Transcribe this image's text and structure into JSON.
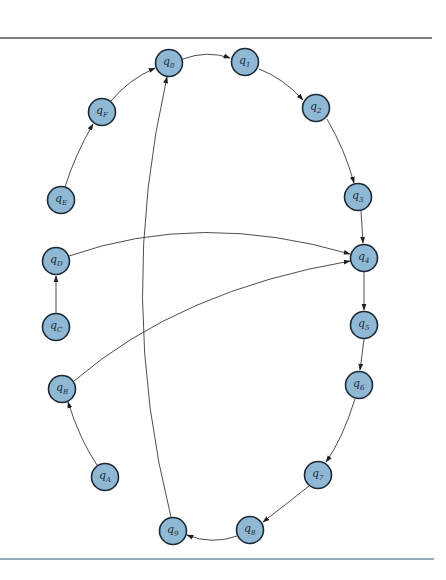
{
  "diagram": {
    "type": "directed-graph",
    "rules": {
      "top": {
        "y": 38,
        "x1": 0,
        "x2": 432,
        "color": "#555555"
      },
      "bottom": {
        "y": 559,
        "x1": 0,
        "x2": 434,
        "color": "#6f8fa6"
      }
    },
    "node_style": {
      "radius": 13.5,
      "fill": "#8fb8d4",
      "stroke": "#1c2a35"
    },
    "nodes": [
      {
        "id": "q0",
        "label": "q",
        "sub": "0",
        "x": 169,
        "y": 63
      },
      {
        "id": "q1",
        "label": "q",
        "sub": "1",
        "x": 245,
        "y": 62
      },
      {
        "id": "q2",
        "label": "q",
        "sub": "2",
        "x": 316,
        "y": 108
      },
      {
        "id": "q3",
        "label": "q",
        "sub": "3",
        "x": 358,
        "y": 197
      },
      {
        "id": "q4",
        "label": "q",
        "sub": "4",
        "x": 364,
        "y": 258
      },
      {
        "id": "q5",
        "label": "q",
        "sub": "5",
        "x": 364,
        "y": 325
      },
      {
        "id": "q6",
        "label": "q",
        "sub": "6",
        "x": 359,
        "y": 385
      },
      {
        "id": "q7",
        "label": "q",
        "sub": "7",
        "x": 318,
        "y": 475
      },
      {
        "id": "q8",
        "label": "q",
        "sub": "8",
        "x": 250,
        "y": 530
      },
      {
        "id": "q9",
        "label": "q",
        "sub": "9",
        "x": 173,
        "y": 531
      },
      {
        "id": "qA",
        "label": "q",
        "sub": "A",
        "x": 105,
        "y": 477
      },
      {
        "id": "qB",
        "label": "q",
        "sub": "B",
        "x": 62,
        "y": 389
      },
      {
        "id": "qC",
        "label": "q",
        "sub": "C",
        "x": 56,
        "y": 327
      },
      {
        "id": "qD",
        "label": "q",
        "sub": "D",
        "x": 56,
        "y": 261
      },
      {
        "id": "qE",
        "label": "q",
        "sub": "E",
        "x": 61,
        "y": 200
      },
      {
        "id": "qF",
        "label": "q",
        "sub": "F",
        "x": 102,
        "y": 112
      }
    ],
    "edges": [
      {
        "from": "q0",
        "to": "q1",
        "path": "M183,59 Q207,50 230,58"
      },
      {
        "from": "q1",
        "to": "q2",
        "path": "M259,69 Q283,78 303,100"
      },
      {
        "from": "q2",
        "to": "q3",
        "path": "M327,119 Q345,150 354,183"
      },
      {
        "from": "q3",
        "to": "q4",
        "path": "M361,211 L363,243"
      },
      {
        "from": "q4",
        "to": "q5",
        "path": "M364,272 L364,310"
      },
      {
        "from": "q5",
        "to": "q6",
        "path": "M364,339 Q362,355 360,370"
      },
      {
        "from": "q6",
        "to": "q7",
        "path": "M355,399 Q342,440 326,462"
      },
      {
        "from": "q7",
        "to": "q8",
        "path": "M309,486 Q285,505 263,522"
      },
      {
        "from": "q8",
        "to": "q9",
        "path": "M237,536 Q212,545 187,535"
      },
      {
        "from": "q9",
        "to": "q0",
        "path": "M171,517 Q116,300 167,77"
      },
      {
        "from": "qA",
        "to": "qB",
        "path": "M97,465 Q80,440 68,402"
      },
      {
        "from": "qB",
        "to": "q4",
        "path": "M74,381 Q180,290 350,261"
      },
      {
        "from": "qC",
        "to": "qD",
        "path": "M56,313 L56,276"
      },
      {
        "from": "qD",
        "to": "q4",
        "path": "M69,256 Q200,210 350,254"
      },
      {
        "from": "qE",
        "to": "qF",
        "path": "M65,187 Q75,155 93,124"
      },
      {
        "from": "qF",
        "to": "q0",
        "path": "M111,101 Q128,80 155,68"
      }
    ]
  }
}
